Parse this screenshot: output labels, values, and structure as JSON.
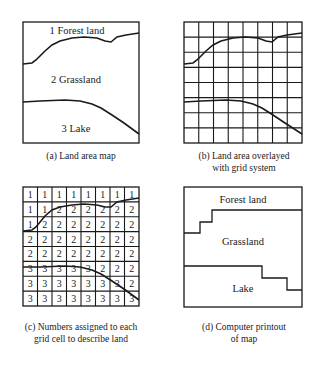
{
  "panels": {
    "a": {
      "caption": "(a) Land area map",
      "labels": {
        "forest": "1 Forest land",
        "grass": "2 Grassland",
        "lake": "3 Lake"
      }
    },
    "b": {
      "caption_line1": "(b) Land area overlayed",
      "caption_line2": "with grid system",
      "grid": {
        "rows": 8,
        "cols": 8
      }
    },
    "c": {
      "caption_line1": "(c) Numbers assigned to each",
      "caption_line2": "grid cell to describe land",
      "cells": [
        [
          "1",
          "1",
          "1",
          "1",
          "1",
          "1",
          "1",
          "1"
        ],
        [
          "1",
          "1",
          "2",
          "2",
          "2",
          "2",
          "2",
          "2"
        ],
        [
          "1",
          "2",
          "2",
          "2",
          "2",
          "2",
          "2",
          "2"
        ],
        [
          "2",
          "2",
          "2",
          "2",
          "2",
          "2",
          "2",
          "2"
        ],
        [
          "2",
          "2",
          "2",
          "2",
          "2",
          "2",
          "2",
          "2"
        ],
        [
          "3",
          "3",
          "3",
          "3",
          "3",
          "2",
          "2",
          "2"
        ],
        [
          "3",
          "3",
          "3",
          "3",
          "3",
          "3",
          "3",
          "2"
        ],
        [
          "3",
          "3",
          "3",
          "3",
          "3",
          "3",
          "3",
          "3"
        ]
      ]
    },
    "d": {
      "caption_line1": "(d) Computer printout",
      "caption_line2": "of map",
      "labels": {
        "forest": "Forest land",
        "grass": "Grassland",
        "lake": "Lake"
      }
    }
  },
  "colors": {
    "line": "#1a1a1a",
    "background": "#ffffff"
  }
}
